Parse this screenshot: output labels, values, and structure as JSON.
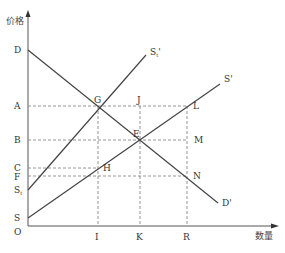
{
  "diagram": {
    "type": "supply-demand-tax",
    "axes": {
      "y_label": "价格",
      "x_label": "数量",
      "origin_label": "O"
    },
    "y_ticks": [
      {
        "label": "D",
        "y": 50
      },
      {
        "label": "A",
        "y": 106
      },
      {
        "label": "B",
        "y": 140
      },
      {
        "label": "C",
        "y": 168
      },
      {
        "label": "F",
        "y": 176
      },
      {
        "label": "St",
        "y": 190
      },
      {
        "label": "S",
        "y": 218
      }
    ],
    "x_ticks": [
      {
        "label": "I",
        "x": 98
      },
      {
        "label": "K",
        "x": 140
      },
      {
        "label": "R",
        "x": 187
      }
    ],
    "curves": {
      "demand": {
        "label": "D'"
      },
      "supply_tax": {
        "label": "St'"
      },
      "supply": {
        "label": "S'"
      }
    },
    "points": {
      "G": "G",
      "J": "J",
      "L": "L",
      "E": "E",
      "M": "M",
      "H": "H",
      "N": "N"
    }
  },
  "labels": {
    "y_axis": "价格",
    "x_axis": "数量",
    "O": "O",
    "D": "D",
    "A": "A",
    "B": "B",
    "C": "C",
    "F": "F",
    "St_main": "S",
    "St_sub": "t",
    "S": "S",
    "I": "I",
    "K": "K",
    "R": "R",
    "G": "G",
    "J": "J",
    "L": "L",
    "E": "E",
    "M": "M",
    "H": "H",
    "N": "N",
    "Dprime": "D'",
    "Sprime": "S'",
    "St_curve_main": "S",
    "St_curve_sub": "t",
    "St_curve_prime": "'"
  }
}
